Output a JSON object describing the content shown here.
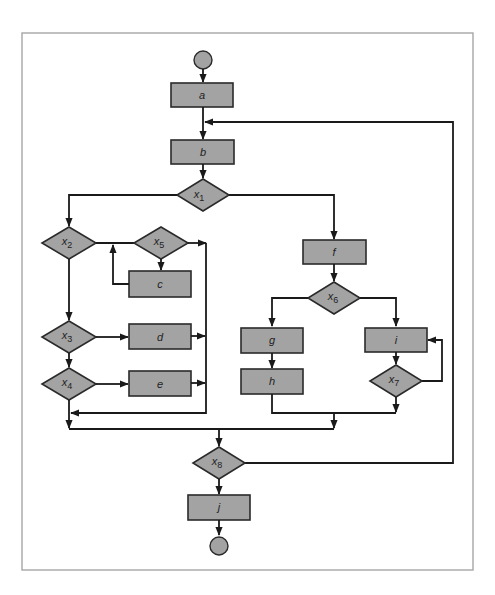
{
  "diagram": {
    "type": "flowchart",
    "colors": {
      "node_fill": "#a3a3a3",
      "stroke": "#1a1a1a",
      "frame": "#a6a6a6",
      "background": "#ffffff"
    },
    "terminals": {
      "start": "start",
      "end": "end"
    },
    "processes": {
      "a": "a",
      "b": "b",
      "c": "c",
      "d": "d",
      "e": "e",
      "f": "f",
      "g": "g",
      "h": "h",
      "i": "i",
      "j": "j"
    },
    "decisions": {
      "x1": {
        "var": "x",
        "sub": "1"
      },
      "x2": {
        "var": "x",
        "sub": "2"
      },
      "x3": {
        "var": "x",
        "sub": "3"
      },
      "x4": {
        "var": "x",
        "sub": "4"
      },
      "x5": {
        "var": "x",
        "sub": "5"
      },
      "x6": {
        "var": "x",
        "sub": "6"
      },
      "x7": {
        "var": "x",
        "sub": "7"
      },
      "x8": {
        "var": "x",
        "sub": "8"
      }
    },
    "edges": [
      [
        "start",
        "a"
      ],
      [
        "a",
        "b"
      ],
      [
        "b",
        "x1"
      ],
      [
        "x1",
        "x2"
      ],
      [
        "x1",
        "f"
      ],
      [
        "x2",
        "x5"
      ],
      [
        "x5",
        "c"
      ],
      [
        "c",
        "x5"
      ],
      [
        "x5",
        "merge-left"
      ],
      [
        "x2",
        "x3"
      ],
      [
        "x3",
        "d"
      ],
      [
        "d",
        "merge-left"
      ],
      [
        "x3",
        "x4"
      ],
      [
        "x4",
        "e"
      ],
      [
        "e",
        "merge-left"
      ],
      [
        "x4",
        "merge-main"
      ],
      [
        "merge-left",
        "merge-main"
      ],
      [
        "f",
        "x6"
      ],
      [
        "x6",
        "g"
      ],
      [
        "g",
        "h"
      ],
      [
        "h",
        "merge-right"
      ],
      [
        "x6",
        "i"
      ],
      [
        "i",
        "x7"
      ],
      [
        "x7",
        "i"
      ],
      [
        "x7",
        "merge-right"
      ],
      [
        "merge-right",
        "merge-main"
      ],
      [
        "merge-main",
        "x8"
      ],
      [
        "x8",
        "j"
      ],
      [
        "x8",
        "b"
      ],
      [
        "j",
        "end"
      ]
    ]
  }
}
